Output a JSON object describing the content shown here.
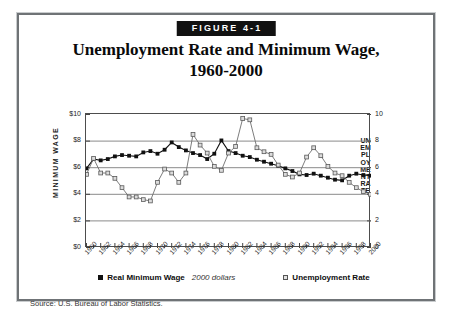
{
  "figure": {
    "banner": "FIGURE 4-1",
    "title_line1": "Unemployment Rate and Minimum Wage,",
    "title_line2": "1960-2000",
    "source": "Source: U.S. Bureau of Labor Statistics."
  },
  "legend": {
    "series1_label": "Real Minimum Wage",
    "series1_note": "2000 dollars",
    "series2_label": "Unemployment Rate"
  },
  "chart_data": {
    "type": "line",
    "title": "Unemployment Rate and Minimum Wage, 1960-2000",
    "xlabel": "",
    "ylabel": "MINIMUM WAGE",
    "y2label": "UNEMPLOYMENT RATE",
    "xlim": [
      1960,
      2000
    ],
    "ylim": [
      0,
      10
    ],
    "y2lim": [
      0,
      10
    ],
    "grid": true,
    "legend_position": "bottom",
    "x": [
      1960,
      1961,
      1962,
      1963,
      1964,
      1965,
      1966,
      1967,
      1968,
      1969,
      1970,
      1971,
      1972,
      1973,
      1974,
      1975,
      1976,
      1977,
      1978,
      1979,
      1980,
      1981,
      1982,
      1983,
      1984,
      1985,
      1986,
      1987,
      1988,
      1989,
      1990,
      1991,
      1992,
      1993,
      1994,
      1995,
      1996,
      1997,
      1998,
      1999,
      2000
    ],
    "xticks": [
      1960,
      1962,
      1964,
      1966,
      1968,
      1970,
      1972,
      1974,
      1976,
      1978,
      1980,
      1982,
      1984,
      1986,
      1988,
      1990,
      1992,
      1994,
      1996,
      1998,
      2000
    ],
    "xticklabels": [
      "1960",
      "1962",
      "1964",
      "1966",
      "1968",
      "1970",
      "1972",
      "1974",
      "1976",
      "1978",
      "1980",
      "1982",
      "1984",
      "1986",
      "1988",
      "1990",
      "1992",
      "1994",
      "1996",
      "1998",
      "2000"
    ],
    "yticks": [
      0,
      2,
      4,
      6,
      8,
      10
    ],
    "yticklabels": [
      "$0",
      "$2",
      "$4",
      "$6",
      "$8",
      "$10"
    ],
    "y2ticks": [
      0,
      2,
      4,
      6,
      8,
      10
    ],
    "y2ticklabels": [
      "0",
      "2",
      "4",
      "6",
      "8",
      "10"
    ],
    "series": [
      {
        "name": "Real Minimum Wage",
        "note": "2000 dollars",
        "marker": "filled-square",
        "color": "#111111",
        "values": [
          5.95,
          6.65,
          6.55,
          6.65,
          6.85,
          6.95,
          6.9,
          6.85,
          7.15,
          7.25,
          7.05,
          7.35,
          7.9,
          7.55,
          7.3,
          7.1,
          6.95,
          6.65,
          7.05,
          8.05,
          7.25,
          7.1,
          6.9,
          6.8,
          6.6,
          6.45,
          6.3,
          6.15,
          5.95,
          5.75,
          5.5,
          5.45,
          5.55,
          5.4,
          5.25,
          5.1,
          5.05,
          5.4,
          5.55,
          5.45,
          5.4
        ]
      },
      {
        "name": "Unemployment Rate",
        "marker": "open-square",
        "color": "#9c9c9c",
        "values": [
          5.5,
          6.7,
          5.6,
          5.6,
          5.2,
          4.5,
          3.8,
          3.8,
          3.6,
          3.5,
          4.9,
          5.9,
          5.6,
          4.9,
          5.6,
          8.5,
          7.7,
          7.1,
          6.1,
          5.8,
          7.1,
          7.6,
          9.7,
          9.6,
          7.5,
          7.2,
          7.0,
          6.2,
          5.5,
          5.3,
          5.6,
          6.8,
          7.5,
          6.9,
          6.1,
          5.6,
          5.4,
          4.9,
          4.5,
          4.2,
          4.0
        ]
      }
    ]
  }
}
